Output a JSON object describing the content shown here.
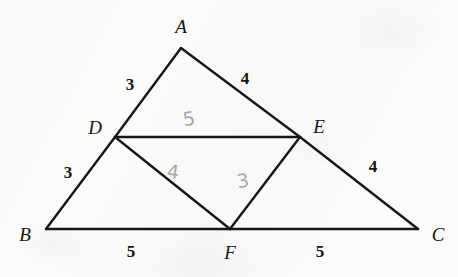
{
  "figure": {
    "background_color": "#fbfbfa",
    "stroke_color": "#161616",
    "handwriting_color": "#a9a9a9",
    "width": 458,
    "height": 277
  },
  "vertices": [
    {
      "id": "A",
      "label": "A",
      "x": 181,
      "y": 48,
      "label_x": 181,
      "label_y": 26
    },
    {
      "id": "B",
      "label": "B",
      "x": 46,
      "y": 229,
      "label_x": 25,
      "label_y": 234
    },
    {
      "id": "C",
      "label": "C",
      "x": 418,
      "y": 229,
      "label_x": 438,
      "label_y": 234
    },
    {
      "id": "D",
      "label": "D",
      "x": 115,
      "y": 137,
      "label_x": 95,
      "label_y": 127
    },
    {
      "id": "E",
      "label": "E",
      "x": 300,
      "y": 137,
      "label_x": 319,
      "label_y": 126
    },
    {
      "id": "F",
      "label": "F",
      "x": 230,
      "y": 229,
      "label_x": 230,
      "label_y": 252
    }
  ],
  "segments": [
    {
      "id": "AD",
      "from": "A",
      "to": "D",
      "x1": 181,
      "y1": 48,
      "x2": 115,
      "y2": 137
    },
    {
      "id": "DB",
      "from": "D",
      "to": "B",
      "x1": 115,
      "y1": 137,
      "x2": 46,
      "y2": 229
    },
    {
      "id": "AE",
      "from": "A",
      "to": "E",
      "x1": 181,
      "y1": 48,
      "x2": 300,
      "y2": 137
    },
    {
      "id": "EC",
      "from": "E",
      "to": "C",
      "x1": 300,
      "y1": 137,
      "x2": 418,
      "y2": 229
    },
    {
      "id": "BF",
      "from": "B",
      "to": "F",
      "x1": 46,
      "y1": 229,
      "x2": 230,
      "y2": 229
    },
    {
      "id": "FC",
      "from": "F",
      "to": "C",
      "x1": 230,
      "y1": 229,
      "x2": 418,
      "y2": 229
    },
    {
      "id": "DE",
      "from": "D",
      "to": "E",
      "x1": 115,
      "y1": 137,
      "x2": 300,
      "y2": 137
    },
    {
      "id": "DF",
      "from": "D",
      "to": "F",
      "x1": 115,
      "y1": 137,
      "x2": 230,
      "y2": 229
    },
    {
      "id": "EF",
      "from": "E",
      "to": "F",
      "x1": 300,
      "y1": 137,
      "x2": 230,
      "y2": 229
    }
  ],
  "edge_labels": [
    {
      "id": "len-AD",
      "segment": "AD",
      "text": "3",
      "x": 130,
      "y": 84
    },
    {
      "id": "len-AE",
      "segment": "AE",
      "text": "4",
      "x": 245,
      "y": 78
    },
    {
      "id": "len-DB",
      "segment": "DB",
      "text": "3",
      "x": 68,
      "y": 172
    },
    {
      "id": "len-EC",
      "segment": "EC",
      "text": "4",
      "x": 373,
      "y": 166
    },
    {
      "id": "len-BF",
      "segment": "BF",
      "text": "5",
      "x": 131,
      "y": 251
    },
    {
      "id": "len-FC",
      "segment": "FC",
      "text": "5",
      "x": 320,
      "y": 251
    }
  ],
  "handwritten_labels": [
    {
      "id": "hand-DE",
      "segment": "DE",
      "text": "5",
      "x": 189,
      "y": 119,
      "tilt": "tilt-left"
    },
    {
      "id": "hand-DF",
      "segment": "DF",
      "text": "4",
      "x": 173,
      "y": 172,
      "tilt": "tilt-right"
    },
    {
      "id": "hand-EF",
      "segment": "EF",
      "text": "3",
      "x": 243,
      "y": 181,
      "tilt": "tilt-left"
    }
  ]
}
